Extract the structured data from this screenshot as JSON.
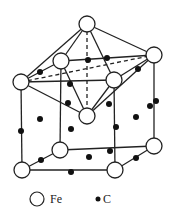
{
  "diagram": {
    "header_fragments": [
      "",
      ""
    ],
    "colors": {
      "line": "#222222",
      "fe_fill": "#ffffff",
      "fe_stroke": "#222222",
      "c_fill": "#111111",
      "background": "#ffffff"
    },
    "fe_radius": 8,
    "c_radius": 3,
    "fe_atoms": [
      {
        "id": "apex-top",
        "x": 87,
        "y": 24
      },
      {
        "id": "upper-left",
        "x": 21,
        "y": 82
      },
      {
        "id": "upper-back",
        "x": 61,
        "y": 61
      },
      {
        "id": "upper-front",
        "x": 114,
        "y": 80
      },
      {
        "id": "upper-right",
        "x": 154,
        "y": 55
      },
      {
        "id": "apex-bottom",
        "x": 87,
        "y": 116
      },
      {
        "id": "lower-left",
        "x": 22,
        "y": 170
      },
      {
        "id": "lower-back",
        "x": 60,
        "y": 150
      },
      {
        "id": "lower-front",
        "x": 115,
        "y": 170
      },
      {
        "id": "lower-right",
        "x": 154,
        "y": 146
      }
    ],
    "c_atoms": [
      {
        "x": 40,
        "y": 72
      },
      {
        "x": 88,
        "y": 60
      },
      {
        "x": 138,
        "y": 69
      },
      {
        "x": 70,
        "y": 84
      },
      {
        "x": 107,
        "y": 58
      },
      {
        "x": 68,
        "y": 103
      },
      {
        "x": 109,
        "y": 104
      },
      {
        "x": 40,
        "y": 119
      },
      {
        "x": 21,
        "y": 131
      },
      {
        "x": 150,
        "y": 106
      },
      {
        "x": 156,
        "y": 101
      },
      {
        "x": 71,
        "y": 129
      },
      {
        "x": 116,
        "y": 127
      },
      {
        "x": 136,
        "y": 117
      },
      {
        "x": 110,
        "y": 151
      },
      {
        "x": 89,
        "y": 157
      },
      {
        "x": 41,
        "y": 160
      },
      {
        "x": 71,
        "y": 172
      },
      {
        "x": 136,
        "y": 158
      }
    ],
    "solid_edges": [
      [
        "apex-top",
        "upper-left"
      ],
      [
        "apex-top",
        "upper-back"
      ],
      [
        "apex-top",
        "upper-front"
      ],
      [
        "apex-top",
        "upper-right"
      ],
      [
        "upper-left",
        "upper-back"
      ],
      [
        "upper-back",
        "upper-right"
      ],
      [
        "upper-left",
        "upper-front"
      ],
      [
        "upper-front",
        "upper-right"
      ],
      [
        "upper-left",
        "apex-bottom"
      ],
      [
        "upper-back",
        "apex-bottom"
      ],
      [
        "upper-front",
        "apex-bottom"
      ],
      [
        "upper-right",
        "apex-bottom"
      ],
      [
        "upper-left",
        "lower-left"
      ],
      [
        "upper-back",
        "lower-back"
      ],
      [
        "upper-front",
        "lower-front"
      ],
      [
        "upper-right",
        "lower-right"
      ],
      [
        "lower-left",
        "lower-back"
      ],
      [
        "lower-back",
        "lower-right"
      ],
      [
        "lower-left",
        "lower-front"
      ],
      [
        "lower-front",
        "lower-right"
      ]
    ],
    "dashed_edges": [
      [
        "apex-top",
        "apex-bottom"
      ],
      [
        "upper-left",
        "upper-right"
      ]
    ],
    "legend": {
      "fe_label": "Fe",
      "c_label": "C",
      "fe_symbol": {
        "x": 37,
        "y": 199,
        "r": 7
      },
      "fe_text": {
        "x": 50,
        "y": 203
      },
      "c_symbol": {
        "x": 98,
        "y": 199,
        "r": 2.5
      },
      "c_text": {
        "x": 103,
        "y": 203
      }
    }
  }
}
